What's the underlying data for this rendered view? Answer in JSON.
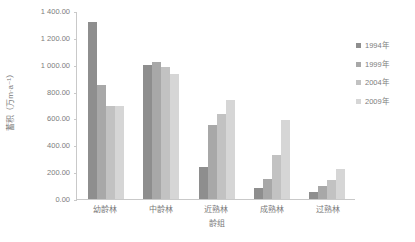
{
  "chart_data": {
    "type": "bar",
    "title": "",
    "xlabel": "龄组",
    "ylabel": "蓄积（万m·a⁻¹）",
    "categories": [
      "幼龄林",
      "中龄林",
      "近熟林",
      "成熟林",
      "过熟林"
    ],
    "series": [
      {
        "name": "1994年",
        "color": "#8e8e8e",
        "values": [
          1320.0,
          1000.0,
          240.0,
          80.0,
          50.0
        ]
      },
      {
        "name": "1999年",
        "color": "#a8a8a8",
        "values": [
          850.0,
          1020.0,
          550.0,
          150.0,
          95.0
        ]
      },
      {
        "name": "2004年",
        "color": "#c2c2c2",
        "values": [
          690.0,
          980.0,
          630.0,
          330.0,
          140.0
        ]
      },
      {
        "name": "2009年",
        "color": "#d6d6d6",
        "values": [
          690.0,
          930.0,
          740.0,
          590.0,
          225.0
        ]
      }
    ],
    "ylim": [
      0,
      1400
    ],
    "ytick_values": [
      0,
      200,
      400,
      600,
      800,
      1000,
      1200,
      1400
    ],
    "ytick_labels": [
      "0.00",
      "200.00",
      "400.00",
      "600.00",
      "800.00",
      "1 000.00",
      "1 200.00",
      "1 400.00"
    ],
    "grid": false,
    "legend_position": "right",
    "legend_entries": [
      "1994年",
      "1999年",
      "2004年",
      "2009年"
    ]
  }
}
